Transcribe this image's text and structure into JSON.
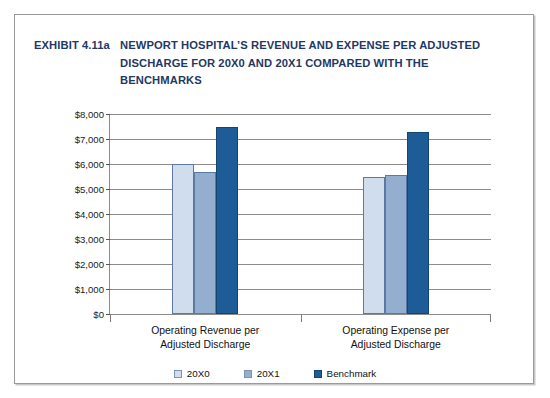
{
  "exhibit": {
    "label": "EXHIBIT 4.11a",
    "title_lines": [
      "NEWPORT HOSPITAL’S REVENUE AND EXPENSE PER ADJUSTED",
      "DISCHARGE FOR 20X0 AND 20X1 COMPARED WITH THE",
      "BENCHMARKS"
    ],
    "title_color": "#1f3864"
  },
  "chart_data": {
    "type": "bar",
    "title": "NEWPORT HOSPITAL’S REVENUE AND EXPENSE PER ADJUSTED DISCHARGE FOR 20X0 AND 20X1 COMPARED WITH THE BENCHMARKS",
    "categories": [
      "Operating Revenue per Adjusted Discharge",
      "Operating Expense per Adjusted Discharge"
    ],
    "category_lines": [
      [
        "Operating Revenue per",
        "Adjusted Discharge"
      ],
      [
        "Operating Expense per",
        "Adjusted Discharge"
      ]
    ],
    "series": [
      {
        "name": "20X0",
        "color": "#cfdded",
        "values": [
          6000,
          5500
        ]
      },
      {
        "name": "20X1",
        "color": "#93aece",
        "values": [
          5700,
          5550
        ]
      },
      {
        "name": "Benchmark",
        "color": "#1d5c96",
        "values": [
          7500,
          7300
        ]
      }
    ],
    "xlabel": "",
    "ylabel": "",
    "ylim": [
      0,
      8000
    ],
    "ytick_values": [
      0,
      1000,
      2000,
      3000,
      4000,
      5000,
      6000,
      7000,
      8000
    ],
    "ytick_labels": [
      "$0",
      "$1,000",
      "$2,000",
      "$3,000",
      "$4,000",
      "$5,000",
      "$6,000",
      "$7,000",
      "$8,000"
    ],
    "grid": true,
    "legend_position": "bottom"
  }
}
